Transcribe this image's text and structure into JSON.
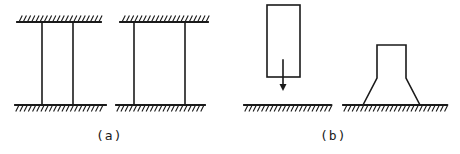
{
  "diagram": {
    "stroke_color": "#1a1a1a",
    "background": "#ffffff",
    "panels": [
      {
        "id": "a",
        "label": "(a)",
        "label_pos": [
          96,
          128
        ],
        "figures": [
          {
            "name": "fixed-fixed-column-pair-narrow",
            "top_support": {
              "x1": 17,
              "x2": 101,
              "y": 22,
              "hatch": "above"
            },
            "bottom_support": {
              "x1": 15,
              "x2": 106,
              "y": 105,
              "hatch": "below"
            },
            "columns": [
              {
                "x": 42,
                "y1": 22,
                "y2": 105
              },
              {
                "x": 73,
                "y1": 22,
                "y2": 105
              }
            ]
          },
          {
            "name": "fixed-fixed-column-pair-wide",
            "top_support": {
              "x1": 120,
              "x2": 208,
              "y": 22,
              "hatch": "above"
            },
            "bottom_support": {
              "x1": 116,
              "x2": 205,
              "y": 105,
              "hatch": "below"
            },
            "columns": [
              {
                "x": 134,
                "y1": 22,
                "y2": 105
              },
              {
                "x": 185,
                "y1": 22,
                "y2": 105
              }
            ]
          }
        ]
      },
      {
        "id": "b",
        "label": "(b)",
        "label_pos": [
          320,
          128
        ],
        "figures": [
          {
            "name": "falling-block",
            "block": {
              "x": 267,
              "y": 5,
              "w": 33,
              "h": 72
            },
            "arrow": {
              "x": 283,
              "y1": 60,
              "y2": 91,
              "direction": "down"
            },
            "ground": {
              "x1": 244,
              "x2": 331,
              "y": 105,
              "hatch": "below"
            }
          },
          {
            "name": "pedestal-on-ground",
            "outline": [
              [
                363,
                105
              ],
              [
                377,
                78
              ],
              [
                377,
                45
              ],
              [
                406,
                45
              ],
              [
                406,
                78
              ],
              [
                420,
                105
              ]
            ],
            "ground": {
              "x1": 343,
              "x2": 447,
              "y": 105,
              "hatch": "below"
            }
          }
        ]
      }
    ]
  }
}
